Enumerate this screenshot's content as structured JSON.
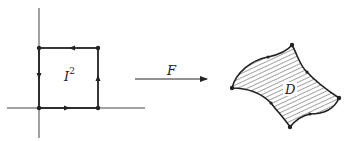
{
  "diagram": {
    "left_figure": {
      "label_base": "I",
      "label_exp": "2",
      "description": "unit square in coordinate axes with counterclockwise boundary orientation"
    },
    "map_arrow": {
      "label": "F"
    },
    "right_figure": {
      "label": "D",
      "description": "hatched curvilinear region with 4 corner vertices and 4 edge midpoint dots"
    },
    "colors": {
      "stroke": "#222222",
      "background": "#ffffff"
    }
  }
}
